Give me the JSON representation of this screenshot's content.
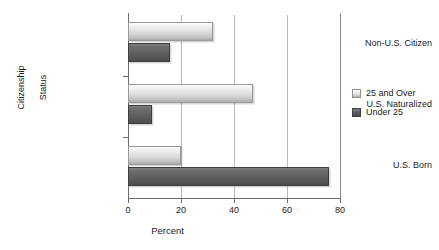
{
  "chart_data": {
    "type": "bar",
    "orientation": "horizontal",
    "title": "",
    "xlabel": "Percent",
    "ylabel": "Citizenship Status",
    "ylabel_lines": [
      "Citizenship",
      "Status"
    ],
    "categories": [
      "Non-U.S. Citizen",
      "U.S. Naturalized",
      "U.S. Born"
    ],
    "series": [
      {
        "name": "25 and Over",
        "color": "#d8d8d8",
        "values": [
          32,
          47,
          20
        ]
      },
      {
        "name": "Under 25",
        "color": "#5c5c5c",
        "values": [
          16,
          9,
          76
        ]
      }
    ],
    "xlim": [
      0,
      80
    ],
    "xticks": [
      0,
      20,
      40,
      60,
      80
    ],
    "xtick_labels": [
      "0",
      "20",
      "40",
      "60",
      "80"
    ],
    "grid": "vertical",
    "legend_position": "right"
  },
  "legend": {
    "entries": [
      {
        "label": "25 and Over"
      },
      {
        "label": "Under 25"
      }
    ]
  },
  "axes": {
    "x_title": "Percent",
    "y_title_line1": "Citizenship",
    "y_title_line2": "Status",
    "tick_0": "0",
    "tick_20": "20",
    "tick_40": "40",
    "tick_60": "60",
    "tick_80": "80"
  },
  "categories": {
    "c0": "Non-U.S. Citizen",
    "c1": "U.S. Naturalized",
    "c2": "U.S. Born"
  }
}
